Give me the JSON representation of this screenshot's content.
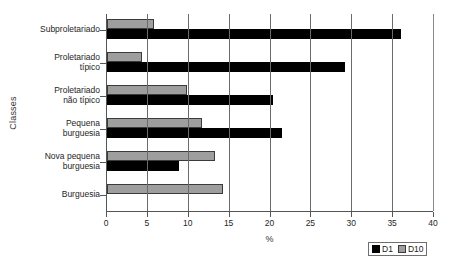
{
  "chart_data": {
    "type": "bar",
    "orientation": "horizontal",
    "title": "",
    "xlabel": "%",
    "ylabel": "Classes",
    "xlim": [
      0,
      40
    ],
    "xticks": [
      0,
      5,
      10,
      15,
      20,
      25,
      30,
      35,
      40
    ],
    "grid": true,
    "grid_axis": "x",
    "legend_position": "bottom-right",
    "categories": [
      "Subproletariado",
      "Proletariado típico",
      "Proletariado não típico",
      "Pequena burguesia",
      "Nova pequena burguesia",
      "Burguesia"
    ],
    "category_lines": [
      [
        "Subproletariado"
      ],
      [
        "Proletariado",
        "típico"
      ],
      [
        "Proletariado",
        "não típico"
      ],
      [
        "Pequena",
        "burguesia"
      ],
      [
        "Nova pequena",
        "burguesia"
      ],
      [
        "Burguesia"
      ]
    ],
    "series": [
      {
        "name": "D1",
        "color": "#000000",
        "values": [
          36.0,
          29.1,
          20.3,
          21.4,
          8.8,
          0
        ]
      },
      {
        "name": "D10",
        "color": "#9e9e9e",
        "values": [
          5.8,
          4.3,
          9.8,
          11.6,
          13.2,
          14.2
        ]
      }
    ]
  },
  "legend": {
    "entries": [
      {
        "label": "D1"
      },
      {
        "label": "D10"
      }
    ]
  }
}
